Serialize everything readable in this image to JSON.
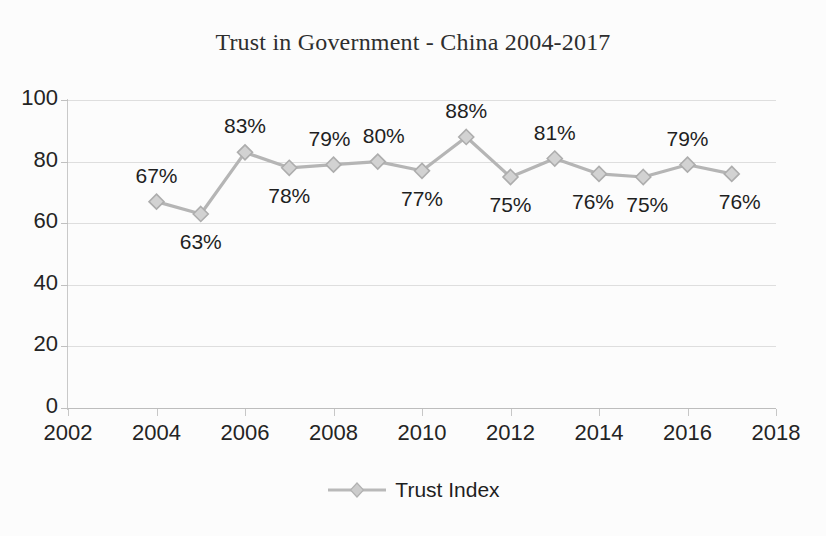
{
  "chart_data": {
    "type": "line",
    "title": "Trust in Government - China 2004-2017",
    "xlabel": "",
    "ylabel": "",
    "xlim": [
      2002,
      2018
    ],
    "ylim": [
      0,
      100
    ],
    "grid": true,
    "legend_position": "bottom",
    "series": [
      {
        "name": "Trust Index",
        "color": "#b5b5b5",
        "marker": "diamond",
        "x": [
          2004,
          2005,
          2006,
          2007,
          2008,
          2009,
          2010,
          2011,
          2012,
          2013,
          2014,
          2015,
          2016,
          2017
        ],
        "values": [
          67,
          63,
          83,
          78,
          79,
          80,
          77,
          88,
          75,
          81,
          76,
          75,
          79,
          76
        ],
        "point_labels": [
          "67%",
          "63%",
          "83%",
          "78%",
          "79%",
          "80%",
          "77%",
          "88%",
          "75%",
          "81%",
          "76%",
          "75%",
          "79%",
          "76%"
        ],
        "label_positions": [
          "above",
          "below",
          "above",
          "below",
          "above",
          "above",
          "below",
          "above",
          "below",
          "above",
          "below",
          "below",
          "above",
          "below"
        ]
      }
    ],
    "x_ticks": [
      2002,
      2004,
      2006,
      2008,
      2010,
      2012,
      2014,
      2016,
      2018
    ],
    "x_tick_labels": [
      "2002",
      "2004",
      "2006",
      "2008",
      "2010",
      "2012",
      "2014",
      "2016",
      "2018"
    ],
    "y_ticks": [
      0,
      20,
      40,
      60,
      80,
      100
    ],
    "y_tick_labels": [
      "0",
      "20",
      "40",
      "60",
      "80",
      "100"
    ]
  },
  "legend": {
    "entries": [
      {
        "label": "Trust Index",
        "color": "#b5b5b5",
        "marker_icon": "diamond-marker-icon"
      }
    ]
  },
  "colors": {
    "series": "#b5b5b5",
    "gridline": "#dedede",
    "axis": "#c0c0c0",
    "text": "#1f1f1f",
    "background": "#fcfcfc"
  }
}
